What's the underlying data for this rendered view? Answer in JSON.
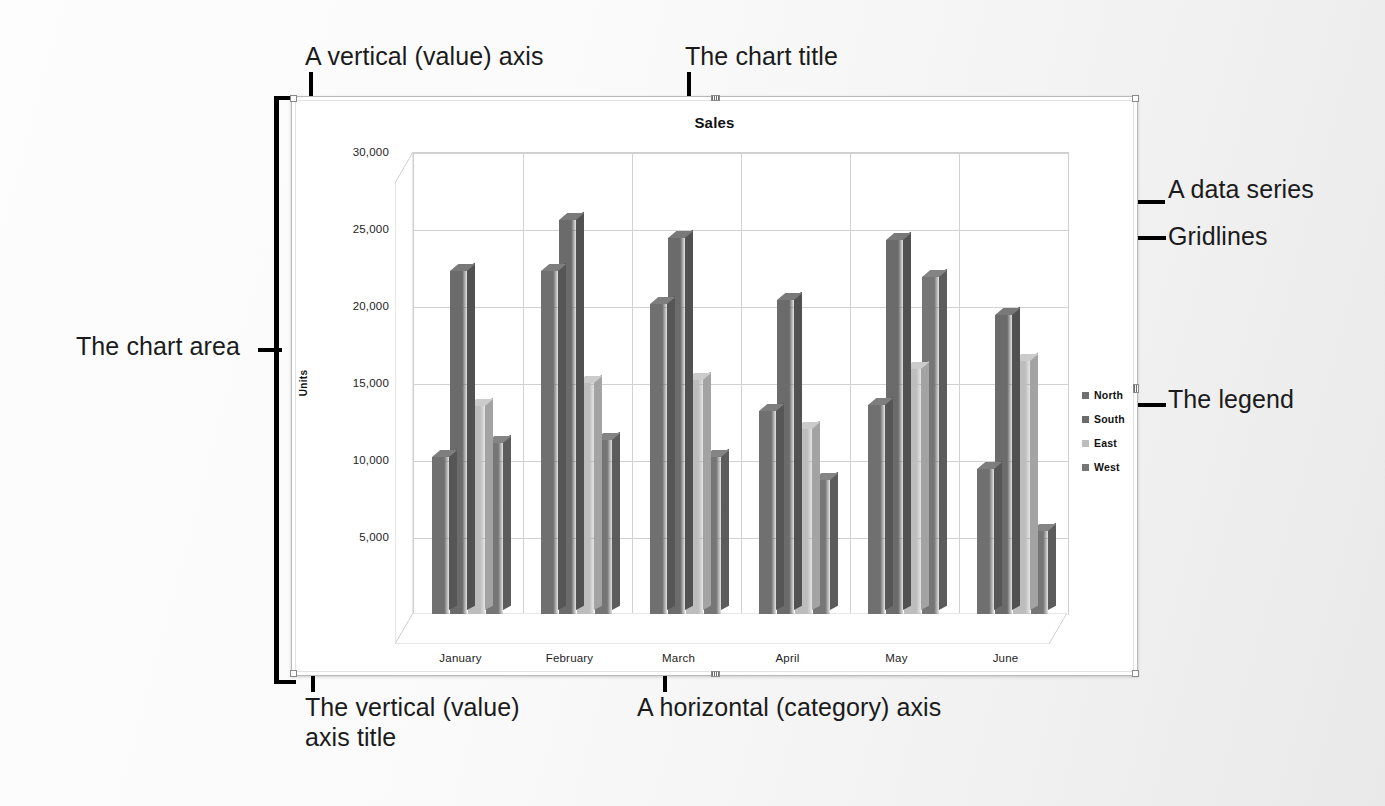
{
  "annotations": {
    "vertical_axis": "A vertical (value) axis",
    "chart_title": "The chart title",
    "data_series": "A data series",
    "gridlines": "Gridlines",
    "legend": "The legend",
    "chart_area": "The chart area",
    "vertical_axis_title": "The vertical (value)\naxis title",
    "horizontal_axis": "A horizontal (category) axis"
  },
  "chart": {
    "title": "Sales",
    "y_axis_title": "Units"
  },
  "chart_data": {
    "type": "bar",
    "title": "Sales",
    "xlabel": "",
    "ylabel": "Units",
    "ylim": [
      0,
      30000
    ],
    "yticks": [
      "5,000",
      "10,000",
      "15,000",
      "20,000",
      "25,000",
      "30,000"
    ],
    "ytick_values": [
      5000,
      10000,
      15000,
      20000,
      25000,
      30000
    ],
    "grid": true,
    "legend_position": "right",
    "categories": [
      "January",
      "February",
      "March",
      "April",
      "May",
      "June"
    ],
    "series": [
      {
        "name": "North",
        "color": "#707070",
        "values": [
          10200,
          22300,
          20100,
          13200,
          13600,
          9400
        ]
      },
      {
        "name": "South",
        "color": "#6b6b6b",
        "values": [
          22300,
          25600,
          24400,
          20400,
          24300,
          19400
        ]
      },
      {
        "name": "East",
        "color": "#bdbdbd",
        "values": [
          13500,
          15000,
          15200,
          12000,
          15900,
          16400
        ]
      },
      {
        "name": "West",
        "color": "#767676",
        "values": [
          11100,
          11300,
          10200,
          8700,
          21900,
          5400
        ]
      }
    ]
  },
  "colors": {
    "line": "#000000",
    "gridline": "#d2d2d2",
    "chart_border": "#b9b9b9"
  }
}
